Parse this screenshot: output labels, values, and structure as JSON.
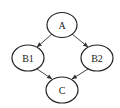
{
  "diagram": {
    "type": "directed-graph",
    "nodes": [
      {
        "id": "A",
        "label": "A",
        "cx": 62,
        "cy": 25
      },
      {
        "id": "B1",
        "label": "B1",
        "cx": 28,
        "cy": 58
      },
      {
        "id": "B2",
        "label": "B2",
        "cx": 97,
        "cy": 58
      },
      {
        "id": "C",
        "label": "C",
        "cx": 62,
        "cy": 90
      }
    ],
    "edges": [
      {
        "from": "A",
        "to": "B1"
      },
      {
        "from": "A",
        "to": "B2"
      },
      {
        "from": "B1",
        "to": "C"
      },
      {
        "from": "B2",
        "to": "C"
      }
    ]
  }
}
